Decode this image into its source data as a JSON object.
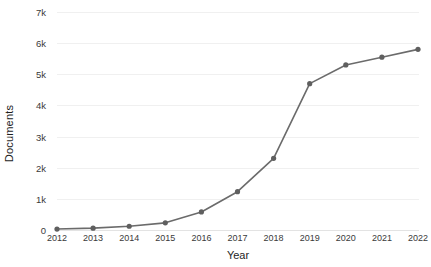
{
  "chart_data": {
    "type": "line",
    "title": "",
    "xlabel": "Year",
    "ylabel": "Documents",
    "categories": [
      "2012",
      "2013",
      "2014",
      "2015",
      "2016",
      "2017",
      "2018",
      "2019",
      "2020",
      "2021",
      "2022"
    ],
    "x": [
      2012,
      2013,
      2014,
      2015,
      2016,
      2017,
      2018,
      2019,
      2020,
      2021,
      2022
    ],
    "values": [
      30,
      60,
      120,
      230,
      580,
      1230,
      2300,
      4700,
      5300,
      5550,
      5800
    ],
    "series": [
      {
        "name": "Documents",
        "values": [
          30,
          60,
          120,
          230,
          580,
          1230,
          2300,
          4700,
          5300,
          5550,
          5800
        ]
      }
    ],
    "ylim": [
      0,
      7000
    ],
    "xlim": [
      2012,
      2022
    ],
    "yticks": [
      0,
      1000,
      2000,
      3000,
      4000,
      5000,
      6000,
      7000
    ],
    "ytick_labels": [
      "0",
      "1k",
      "2k",
      "3k",
      "4k",
      "5k",
      "6k",
      "7k"
    ],
    "xtick_labels": [
      "2012",
      "2013",
      "2014",
      "2015",
      "2016",
      "2017",
      "2018",
      "2019",
      "2020",
      "2021",
      "2022"
    ],
    "grid": true,
    "grid_axis": "y",
    "legend": false,
    "legend_position": "none",
    "marker": "circle",
    "line_color": "#6b6b6b",
    "marker_color": "#5f5f5f",
    "grid_color": "#f0f0f0",
    "background_color": "#ffffff",
    "text_color": "#3a3a3a"
  }
}
